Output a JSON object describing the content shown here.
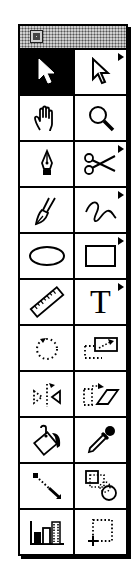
{
  "palette": {
    "title_bar": {
      "close_box": "close-box"
    },
    "selected_tool": "selection",
    "colors": {
      "ink": "#000000",
      "paper": "#ffffff",
      "title_pattern": "#cfcfcf"
    },
    "rows": [
      {
        "left": {
          "id": "selection",
          "icon": "arrow-pointer-icon",
          "flyout": false,
          "selected": true
        },
        "right": {
          "id": "direct-selection",
          "icon": "hollow-arrow-pointer-icon",
          "flyout": true
        }
      },
      {
        "left": {
          "id": "hand",
          "icon": "hand-icon",
          "flyout": false
        },
        "right": {
          "id": "zoom",
          "icon": "magnifier-icon",
          "flyout": false
        }
      },
      {
        "left": {
          "id": "pen",
          "icon": "pen-nib-icon",
          "flyout": false
        },
        "right": {
          "id": "scissors",
          "icon": "scissors-icon",
          "flyout": true
        }
      },
      {
        "left": {
          "id": "brush",
          "icon": "brush-icon",
          "flyout": false
        },
        "right": {
          "id": "freehand",
          "icon": "freehand-squiggle-icon",
          "flyout": true
        }
      },
      {
        "left": {
          "id": "oval",
          "icon": "oval-icon",
          "flyout": false
        },
        "right": {
          "id": "rectangle",
          "icon": "rectangle-icon",
          "flyout": true
        }
      },
      {
        "left": {
          "id": "measure",
          "icon": "ruler-icon",
          "flyout": false
        },
        "right": {
          "id": "type",
          "icon": "type-icon",
          "label": "T",
          "flyout": true
        }
      },
      {
        "left": {
          "id": "rotate",
          "icon": "rotate-icon",
          "flyout": false
        },
        "right": {
          "id": "scale",
          "icon": "scale-icon",
          "flyout": false
        }
      },
      {
        "left": {
          "id": "reflect",
          "icon": "reflect-icon",
          "flyout": false
        },
        "right": {
          "id": "shear",
          "icon": "shear-icon",
          "flyout": false
        }
      },
      {
        "left": {
          "id": "paint-bucket",
          "icon": "paint-bucket-icon",
          "flyout": false
        },
        "right": {
          "id": "eyedropper",
          "icon": "eyedropper-icon",
          "flyout": false
        }
      },
      {
        "left": {
          "id": "blend",
          "icon": "blend-icon",
          "flyout": false
        },
        "right": {
          "id": "auto-trace",
          "icon": "auto-trace-icon",
          "flyout": false
        }
      },
      {
        "left": {
          "id": "graph",
          "icon": "bar-graph-icon",
          "flyout": false
        },
        "right": {
          "id": "page",
          "icon": "page-tool-icon",
          "flyout": false
        }
      }
    ]
  }
}
